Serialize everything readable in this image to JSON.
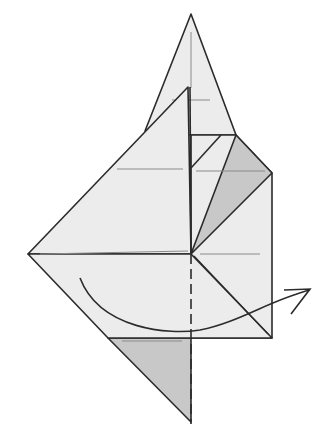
{
  "diagram": {
    "type": "origami-fold-step",
    "colors": {
      "background": "#ffffff",
      "paper": "#ececec",
      "paper_shaded": "#c8c8c8",
      "line": "#2b2b2b",
      "crease": "#8a8a8a"
    },
    "parts": {
      "top_triangle": {
        "label": "Top point"
      },
      "large_flap": {
        "label": "Left flap"
      },
      "right_panel": {
        "label": "Right panel"
      },
      "shaded_flap_right": {
        "label": "Shaded inner flap"
      },
      "bottom_shaded_triangle": {
        "label": "Bottom shaded triangle"
      },
      "valley_fold_line": {
        "label": "Dashed valley fold line"
      },
      "fold_arrow": {
        "label": "Fold direction arrow (left to right)"
      }
    }
  }
}
